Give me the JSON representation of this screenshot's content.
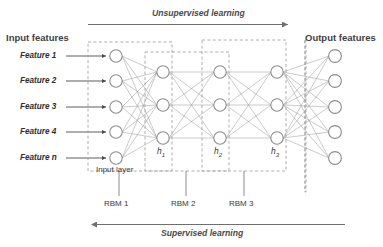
{
  "diagram": {
    "top_arrow": {
      "label": "Unsupervised learning",
      "direction": "right",
      "name": "unsupervised-learning-arrow"
    },
    "bottom_arrow": {
      "label": "Supervised learning",
      "direction": "left",
      "name": "supervised-learning-arrow"
    },
    "left_header": "Input features",
    "right_header": "Output features",
    "input_layer_label": "Input layer",
    "feature_labels": [
      "Feature 1",
      "Feature 2",
      "Feature 3",
      "Feature 4",
      "Feature n"
    ],
    "hidden_layer_labels": [
      {
        "base": "h",
        "sub": "1"
      },
      {
        "base": "h",
        "sub": "2"
      },
      {
        "base": "h",
        "sub": "3"
      }
    ],
    "rbm_labels": [
      "RBM 1",
      "RBM 2",
      "RBM 3"
    ],
    "layers": [
      {
        "name": "input-layer",
        "node_count": 5
      },
      {
        "name": "hidden-layer-h1",
        "node_count": 3
      },
      {
        "name": "hidden-layer-h2",
        "node_count": 3
      },
      {
        "name": "hidden-layer-h3",
        "node_count": 3
      },
      {
        "name": "output-layer",
        "node_count": 5
      }
    ],
    "colors": {
      "node_stroke": "#8d8d8d",
      "edge": "#8a8a8a",
      "dashed_box": "#9a9a9a",
      "arrow": "#6f6f6f",
      "text": "#3a3a3a"
    }
  }
}
